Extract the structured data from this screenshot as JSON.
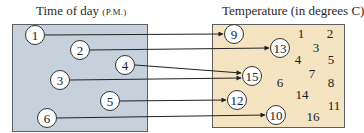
{
  "domain": {
    "title": "Time of day",
    "title_unit": "(P.M.)",
    "fill_color": "#c6d1dc",
    "elements": [
      {
        "label": "1",
        "x": 35,
        "y": 35
      },
      {
        "label": "2",
        "x": 80,
        "y": 50
      },
      {
        "label": "4",
        "x": 125,
        "y": 65
      },
      {
        "label": "3",
        "x": 60,
        "y": 80
      },
      {
        "label": "5",
        "x": 110,
        "y": 101
      },
      {
        "label": "6",
        "x": 47,
        "y": 118
      }
    ]
  },
  "range": {
    "title": "Temperature (in degrees C)",
    "fill_color": "#f4e4c1",
    "circled_elements": [
      {
        "label": "9",
        "x": 234,
        "y": 34
      },
      {
        "label": "13",
        "x": 280,
        "y": 48
      },
      {
        "label": "15",
        "x": 252,
        "y": 76
      },
      {
        "label": "12",
        "x": 237,
        "y": 100
      },
      {
        "label": "10",
        "x": 276,
        "y": 115
      }
    ],
    "other_elements": [
      {
        "label": "1",
        "x": 301,
        "y": 33
      },
      {
        "label": "2",
        "x": 330,
        "y": 33
      },
      {
        "label": "3",
        "x": 316,
        "y": 47
      },
      {
        "label": "4",
        "x": 298,
        "y": 59
      },
      {
        "label": "5",
        "x": 331,
        "y": 59
      },
      {
        "label": "7",
        "x": 312,
        "y": 73
      },
      {
        "label": "6",
        "x": 280,
        "y": 82
      },
      {
        "label": "8",
        "x": 331,
        "y": 82
      },
      {
        "label": "14",
        "x": 302,
        "y": 94
      },
      {
        "label": "11",
        "x": 334,
        "y": 105
      },
      {
        "label": "16",
        "x": 313,
        "y": 116
      }
    ]
  },
  "mappings": [
    {
      "from": "1",
      "to": "9",
      "x1": 45,
      "y1": 35,
      "x2": 223,
      "y2": 34
    },
    {
      "from": "2",
      "to": "13",
      "x1": 90,
      "y1": 50,
      "x2": 269,
      "y2": 48
    },
    {
      "from": "4",
      "to": "15",
      "x1": 135,
      "y1": 65,
      "x2": 241,
      "y2": 73
    },
    {
      "from": "3",
      "to": "15",
      "x1": 70,
      "y1": 80,
      "x2": 241,
      "y2": 78
    },
    {
      "from": "5",
      "to": "12",
      "x1": 120,
      "y1": 101,
      "x2": 226,
      "y2": 100
    },
    {
      "from": "6",
      "to": "10",
      "x1": 57,
      "y1": 118,
      "x2": 265,
      "y2": 115
    }
  ]
}
